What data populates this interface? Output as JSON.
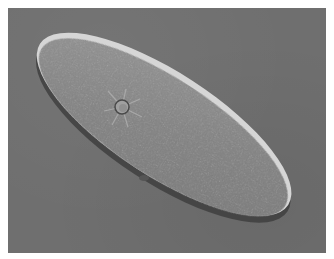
{
  "image": {
    "subject": "Paramecium (ciliate protozoan) under differential interference contrast microscopy",
    "alt": "Elongated slipper-shaped paramecium cell on a gray background, with a visible contractile vacuole showing radiating canals near the upper-left end and cilia fringing the cell outline"
  },
  "colors": {
    "frame": "#ffffff",
    "background": "#6f6f6f",
    "cell_body": "#8a8a8a",
    "cell_edge_highlight": "#d8d8d8",
    "cell_edge_shadow": "#3a3a3a"
  }
}
